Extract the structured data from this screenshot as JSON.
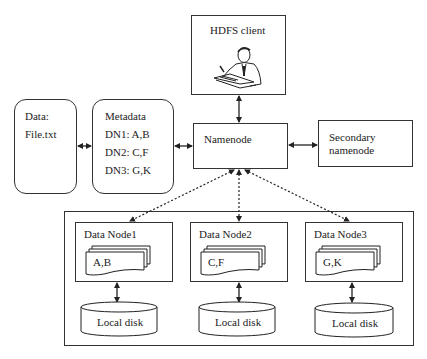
{
  "diagram": {
    "client": {
      "label": "HDFS client",
      "icon": "person-writing-icon"
    },
    "namenode": {
      "label": "Namenode"
    },
    "secondary": {
      "line1": "Secondary",
      "line2": "namenode"
    },
    "data": {
      "line1": "Data:",
      "line2": "File.txt"
    },
    "metadata": {
      "title": "Metadata",
      "entries": [
        "DN1: A,B",
        "DN2: C,F",
        "DN3: G,K"
      ]
    },
    "datanodes": [
      {
        "label": "Data Node1",
        "blocks": "A,B",
        "disk": "Local disk"
      },
      {
        "label": "Data Node2",
        "blocks": "C,F",
        "disk": "Local disk"
      },
      {
        "label": "Data Node3",
        "blocks": "G,K",
        "disk": "Local disk"
      }
    ],
    "colors": {
      "stroke": "#333333",
      "text": "#222222",
      "background": "#ffffff"
    }
  }
}
